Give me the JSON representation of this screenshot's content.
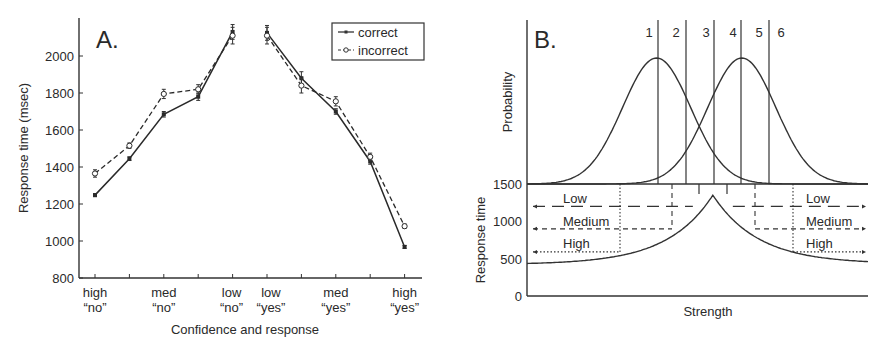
{
  "chart_data": [
    {
      "panel": "A.",
      "type": "line",
      "title": "",
      "xlabel": "Confidence and response",
      "ylabel": "Response time (msec)",
      "ylim": [
        800,
        2200
      ],
      "yticks": [
        800,
        1000,
        1200,
        1400,
        1600,
        1800,
        2000
      ],
      "categories": [
        "1",
        "2",
        "3",
        "4",
        "5",
        "6",
        "7",
        "8",
        "9",
        "10"
      ],
      "xtick_labels": [
        {
          "pos": 0,
          "line1": "high",
          "line2": "“no”"
        },
        {
          "pos": 2,
          "line1": "med",
          "line2": "“no”"
        },
        {
          "pos": 4,
          "line1": "low",
          "line2": "“no”"
        },
        {
          "pos": 5,
          "line1": "low",
          "line2": "“yes”"
        },
        {
          "pos": 7,
          "line1": "med",
          "line2": "“yes”"
        },
        {
          "pos": 9,
          "line1": "high",
          "line2": "“yes”"
        }
      ],
      "series": [
        {
          "name": "correct",
          "marker": "filled-square",
          "line": "solid",
          "values": [
            1248,
            1445,
            1685,
            1780,
            2130,
            2125,
            1880,
            1700,
            1430,
            968
          ],
          "errors": [
            8,
            10,
            15,
            20,
            40,
            40,
            35,
            15,
            15,
            8
          ]
        },
        {
          "name": "incorrect",
          "marker": "open-circle",
          "line": "dashed",
          "values": [
            1365,
            1515,
            1795,
            1820,
            2110,
            2110,
            1840,
            1755,
            1455,
            1080
          ],
          "errors": [
            20,
            15,
            25,
            25,
            45,
            45,
            40,
            25,
            20,
            12
          ]
        }
      ],
      "legend": {
        "position": "upper right",
        "entries": [
          "correct",
          "incorrect"
        ]
      },
      "grid": false
    },
    {
      "panel": "B.",
      "type": "line",
      "title": "",
      "xlabel": "Strength",
      "ylabel_top": "Probability",
      "ylabel_bottom": "Response time",
      "yticks_bottom": [
        0,
        500,
        1000,
        1500
      ],
      "ylim_bottom": [
        0,
        1500
      ],
      "criteria_labels": [
        "1",
        "2",
        "3",
        "4",
        "5",
        "6"
      ],
      "distributions": [
        {
          "name": "noise",
          "mean_x": 0.38,
          "sd": 0.1
        },
        {
          "name": "signal",
          "mean_x": 0.63,
          "sd": 0.1
        }
      ],
      "rt_curve": {
        "peak_x": 0.545,
        "peak_rt": 1350,
        "left_rt": 420,
        "right_rt": 430
      },
      "confidence_bands": [
        {
          "label": "Low",
          "rt": 1200,
          "style": "long-dash"
        },
        {
          "label": "Medium",
          "rt": 900,
          "style": "dash"
        },
        {
          "label": "High",
          "rt": 590,
          "style": "dotted"
        }
      ],
      "grid": false
    }
  ],
  "panelA": {
    "label": "A.",
    "ylabel": "Response time (msec)",
    "xlabel": "Confidence and response",
    "legend": {
      "correct": "correct",
      "incorrect": "incorrect"
    },
    "yticks": [
      "800",
      "1000",
      "1200",
      "1400",
      "1600",
      "1800",
      "2000"
    ],
    "xt": [
      {
        "l1": "high",
        "l2": "“no”"
      },
      {
        "l1": "med",
        "l2": "“no”"
      },
      {
        "l1": "low",
        "l2": "“no”"
      },
      {
        "l1": "low",
        "l2": "“yes”"
      },
      {
        "l1": "med",
        "l2": "“yes”"
      },
      {
        "l1": "high",
        "l2": "“yes”"
      }
    ]
  },
  "panelB": {
    "label": "B.",
    "ylabel_top": "Probability",
    "ylabel_bottom": "Response time",
    "xlabel": "Strength",
    "yticks": [
      "1500",
      "1000",
      "500",
      "0"
    ],
    "criteria": [
      "1",
      "2",
      "3",
      "4",
      "5",
      "6"
    ],
    "bands_left": [
      "Low",
      "Medium",
      "High"
    ],
    "bands_right": [
      "Low",
      "Medium",
      "High"
    ]
  }
}
